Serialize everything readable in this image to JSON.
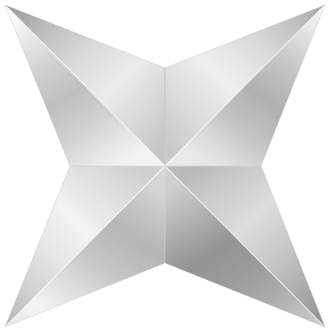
{
  "artwork": {
    "title": "Metallic Four-Pointed Star",
    "subject": "four-pointed-star",
    "style": "faceted chrome / brushed silver",
    "background_color": "#ffffff",
    "canvas": {
      "width": 331,
      "height": 332
    }
  },
  "geometry": {
    "center": {
      "x": 165,
      "y": 166
    },
    "tips": [
      {
        "name": "top-left-tip",
        "x": 5,
        "y": 5
      },
      {
        "name": "top-right-tip",
        "x": 325,
        "y": 5
      },
      {
        "name": "bottom-right-tip",
        "x": 325,
        "y": 327
      },
      {
        "name": "bottom-left-tip",
        "x": 5,
        "y": 327
      }
    ],
    "notches": [
      {
        "name": "top-notch",
        "x": 165,
        "y": 68
      },
      {
        "name": "right-notch",
        "x": 261,
        "y": 166
      },
      {
        "name": "bottom-notch",
        "x": 165,
        "y": 263
      },
      {
        "name": "left-notch",
        "x": 70,
        "y": 166
      }
    ],
    "outline_path": "M 5 5 L 165 68 L 325 5 L 261 166 L 325 327 L 165 263 L 5 327 L 70 166 Z"
  },
  "palette": {
    "highlight_white": "#fdfdfd",
    "light_silver": "#e8e8e8",
    "mid_silver": "#c9c9c9",
    "dark_silver": "#9a9a9a",
    "deep_shadow": "#7e7e7e",
    "edge_line": "#b4b4b4",
    "background": "#ffffff"
  },
  "facets": [
    {
      "id": "facet-tl-upper",
      "label": "top-left point, upper facet",
      "points": "5,5 165,68 165,166",
      "gradient": "grad-tl-upper"
    },
    {
      "id": "facet-tl-lower",
      "label": "top-left point, lower facet",
      "points": "5,5 165,166 70,166",
      "gradient": "grad-tl-lower"
    },
    {
      "id": "facet-tr-upper",
      "label": "top-right point, upper facet",
      "points": "325,5 165,68 165,166",
      "gradient": "grad-tr-upper"
    },
    {
      "id": "facet-tr-lower",
      "label": "top-right point, lower facet",
      "points": "325,5 165,166 261,166",
      "gradient": "grad-tr-lower"
    },
    {
      "id": "facet-br-upper",
      "label": "bottom-right point, upper facet",
      "points": "325,327 261,166 165,166",
      "gradient": "grad-br-upper"
    },
    {
      "id": "facet-br-lower",
      "label": "bottom-right point, lower facet",
      "points": "325,327 165,166 165,263",
      "gradient": "grad-br-lower"
    },
    {
      "id": "facet-bl-upper",
      "label": "bottom-left point, upper facet",
      "points": "5,327 70,166 165,166",
      "gradient": "grad-bl-upper"
    },
    {
      "id": "facet-bl-lower",
      "label": "bottom-left point, lower facet",
      "points": "5,327 165,166 165,263",
      "gradient": "grad-bl-lower"
    }
  ],
  "ridges": [
    {
      "id": "ridge-tl",
      "label": "ridge top-left to center",
      "d": "M 5 5 L 165 166",
      "color": "#f4f4f4",
      "width": 1.1
    },
    {
      "id": "ridge-tr",
      "label": "ridge top-right to center",
      "d": "M 325 5 L 165 166",
      "color": "#f2f2f2",
      "width": 1.1
    },
    {
      "id": "ridge-bl",
      "label": "ridge bottom-left to center",
      "d": "M 5 327 L 165 166",
      "color": "#f6f6f6",
      "width": 1.1
    },
    {
      "id": "ridge-br",
      "label": "ridge bottom-right to center",
      "d": "M 325 327 L 165 166",
      "color": "#efefef",
      "width": 1.1
    },
    {
      "id": "ridge-vert-top",
      "label": "vertical crease top notch to center",
      "d": "M 165 68 L 165 166",
      "color": "#bdbdbd",
      "width": 1.0
    },
    {
      "id": "ridge-vert-bottom",
      "label": "vertical crease center to bottom notch",
      "d": "M 165 166 L 165 263",
      "color": "#c6c6c6",
      "width": 1.0
    },
    {
      "id": "ridge-horz-left",
      "label": "horizontal crease left notch to center",
      "d": "M 70 166 L 165 166",
      "color": "#d4d4d4",
      "width": 1.0
    },
    {
      "id": "ridge-horz-right",
      "label": "horizontal crease center to right notch",
      "d": "M 165 166 L 261 166",
      "color": "#cfcfcf",
      "width": 1.0
    }
  ]
}
